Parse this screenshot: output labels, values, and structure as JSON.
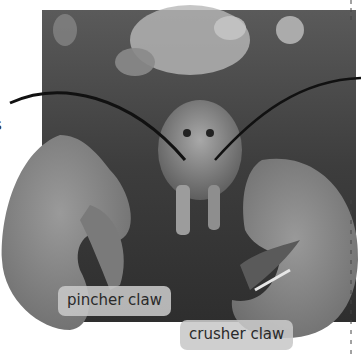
{
  "figure": {
    "palette": {
      "background": "#ffffff",
      "photo_dark": "#3a3a3a",
      "photo_mid": "#6e6e6e",
      "claw": "#8c8c8c",
      "coral_light": "#c4c4c4",
      "label_bg": "#c8c8c8",
      "label_text": "#2a2a2a",
      "leader_line": "#111111"
    },
    "labels": {
      "pincher": "pincher claw",
      "crusher": "crusher claw",
      "cut_off_left": "s"
    }
  }
}
